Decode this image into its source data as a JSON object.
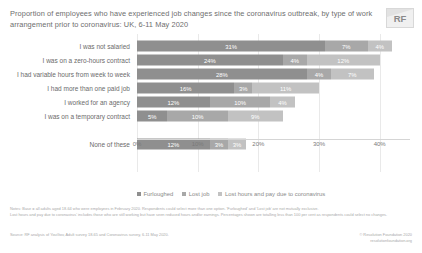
{
  "header": {
    "title": "Proportion of employees who have experienced job changes since the coronavirus outbreak, by type of work arrangement prior to coronavirus: UK, 6-11 May 2020",
    "logo_text": "RF"
  },
  "notes": {
    "line1": "Notes: Base = all adults aged 18-64 who were employees in February 2020. Respondents could select more than one option. 'Furloughed' and 'Lost job' are not mutually exclusive.",
    "line2": "Lost hours and pay due to coronavirus' includes those who are still working but have seen reduced hours and/or earnings. Percentages shown are totalling less than 100 per cent as respondents could select no changes."
  },
  "source": {
    "left": "Source: RF analysis of YouGov, Adult survey 18-65 and Coronavirus survey, 6-11 May 2020.",
    "right_line1": "© Resolution Foundation 2020",
    "right_line2": "resolutionfoundation.org"
  },
  "chart_data": {
    "type": "bar",
    "orientation": "horizontal",
    "stacked": true,
    "title": "Proportion of employees who have experienced job changes since the coronavirus outbreak, by type of work arrangement prior to coronavirus: UK, 6-11 May 2020",
    "xlabel": "",
    "ylabel": "",
    "xlim": [
      0,
      45
    ],
    "grid": true,
    "legend_position": "bottom",
    "xticks": [
      "0%",
      "10%",
      "20%",
      "30%",
      "40%"
    ],
    "xtick_values": [
      0,
      10,
      20,
      30,
      40
    ],
    "categories": [
      "I was not salaried",
      "I was on a zero-hours contract",
      "I had variable hours from week to week",
      "I had more than one paid job",
      "I worked for an agency",
      "I was on a temporary contract",
      "None of these"
    ],
    "series": [
      {
        "name": "Furloughed",
        "color": "#8f8f8f",
        "values": [
          31,
          24,
          28,
          16,
          12,
          5,
          12
        ]
      },
      {
        "name": "Lost job",
        "color": "#a8a8a8",
        "values": [
          7,
          4,
          4,
          3,
          10,
          10,
          3
        ]
      },
      {
        "name": "Lost hours and pay due to coronavirus",
        "color": "#c2c2c2",
        "values": [
          4,
          12,
          7,
          11,
          4,
          9,
          3
        ]
      }
    ],
    "labels": [
      [
        "31%",
        "7%",
        "4%"
      ],
      [
        "24%",
        "4%",
        "12%"
      ],
      [
        "28%",
        "4%",
        "7%"
      ],
      [
        "16%",
        "3%",
        "11%"
      ],
      [
        "12%",
        "10%",
        "4%"
      ],
      [
        "5%",
        "10%",
        "9%"
      ],
      [
        "12%",
        "3%",
        "3%"
      ]
    ]
  }
}
